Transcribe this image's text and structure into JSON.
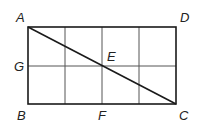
{
  "diagram": {
    "type": "geometry-rectangle-grid",
    "rectangle": {
      "x": 28,
      "y": 27,
      "width": 148,
      "height": 77
    },
    "grid": {
      "columns": 4,
      "rows": 2
    },
    "colors": {
      "outline": "#1a1a1a",
      "grid": "#555555",
      "diagonal": "#1a1a1a",
      "text": "#222222"
    },
    "points": {
      "A": {
        "label": "A",
        "x": 28,
        "y": 27,
        "tx": 16,
        "ty": 22
      },
      "D": {
        "label": "D",
        "x": 176,
        "y": 27,
        "tx": 180,
        "ty": 22
      },
      "B": {
        "label": "B",
        "x": 28,
        "y": 104,
        "tx": 17,
        "ty": 120
      },
      "C": {
        "label": "C",
        "x": 176,
        "y": 104,
        "tx": 179,
        "ty": 120
      },
      "G": {
        "label": "G",
        "x": 28,
        "y": 66,
        "tx": 14,
        "ty": 71
      },
      "E": {
        "label": "E",
        "x": 102,
        "y": 66,
        "tx": 107,
        "ty": 61
      },
      "F": {
        "label": "F",
        "x": 102,
        "y": 104,
        "tx": 98,
        "ty": 120
      }
    },
    "diagonal": {
      "from": "A",
      "to": "C"
    }
  }
}
